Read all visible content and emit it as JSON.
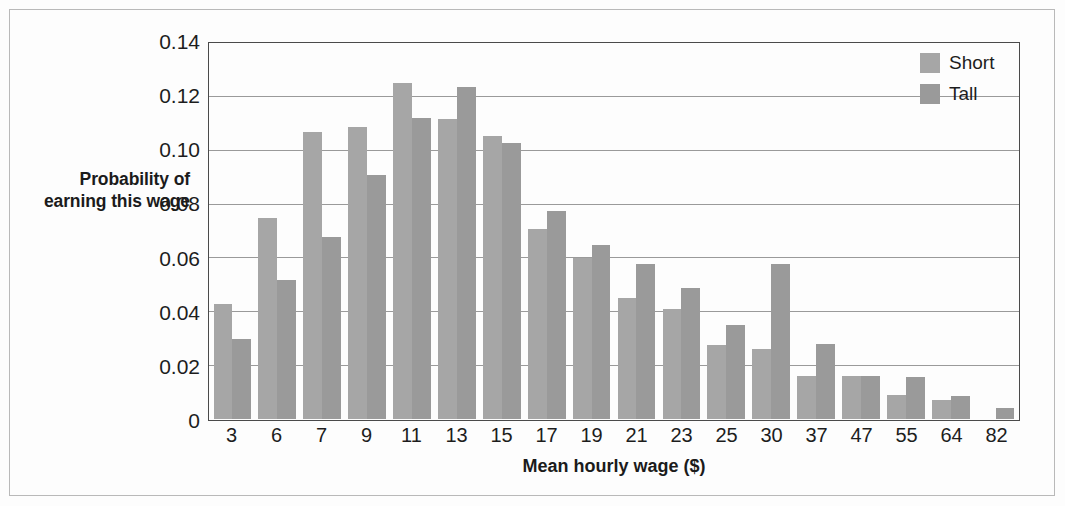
{
  "chart_data": {
    "type": "bar",
    "title": "",
    "xlabel": "Mean hourly wage ($)",
    "ylabel": "Probability of earning this wage",
    "categories": [
      "3",
      "6",
      "7",
      "9",
      "11",
      "13",
      "15",
      "17",
      "19",
      "21",
      "23",
      "25",
      "30",
      "37",
      "47",
      "55",
      "64",
      "82"
    ],
    "series": [
      {
        "name": "Short",
        "color": "#a6a6a6",
        "values": [
          0.043,
          0.075,
          0.107,
          0.109,
          0.1255,
          0.112,
          0.1055,
          0.071,
          0.06,
          0.045,
          0.041,
          0.0275,
          0.026,
          0.016,
          0.016,
          0.009,
          0.007,
          0.0
        ]
      },
      {
        "name": "Tall",
        "color": "#9a9a9a",
        "values": [
          0.03,
          0.052,
          0.068,
          0.091,
          0.1125,
          0.124,
          0.103,
          0.0775,
          0.065,
          0.058,
          0.049,
          0.035,
          0.058,
          0.028,
          0.016,
          0.0155,
          0.0085,
          0.004
        ]
      }
    ],
    "ylim": [
      0,
      0.14
    ],
    "yticks": [
      "0",
      "0.02",
      "0.04",
      "0.06",
      "0.08",
      "0.10",
      "0.12",
      "0.14"
    ],
    "ytick_values": [
      0,
      0.02,
      0.04,
      0.06,
      0.08,
      0.1,
      0.12,
      0.14
    ],
    "grid": true,
    "legend_position": "top-right"
  },
  "legend": {
    "items": [
      {
        "label": "Short"
      },
      {
        "label": "Tall"
      }
    ]
  }
}
